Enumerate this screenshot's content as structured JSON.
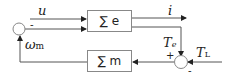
{
  "diagram": {
    "blocks": [
      {
        "id": "electrical",
        "label": "∑ e"
      },
      {
        "id": "mechanical",
        "label": "∑ m"
      }
    ],
    "signals": {
      "u": "u",
      "i": "i",
      "omega_m_sym": "ω",
      "omega_m_sub": "m",
      "Te_sym": "T",
      "Te_sub": "e",
      "TL_sym": "T",
      "TL_sub": "L"
    },
    "signs": {
      "left_junction_minus": "-",
      "right_junction_plus": "+",
      "right_junction_minus": "-"
    },
    "colors": {
      "line": "#555555",
      "box_border": "#888888",
      "text": "#222222"
    }
  }
}
